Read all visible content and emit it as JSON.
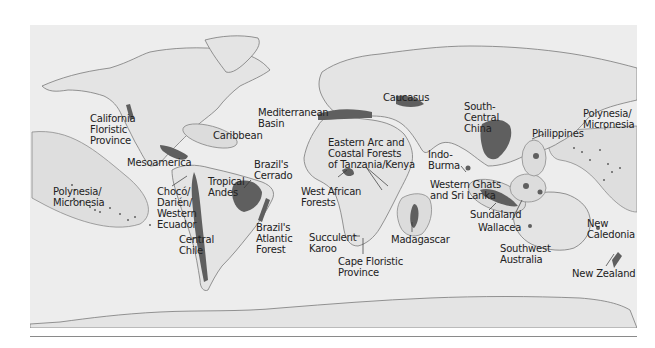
{
  "map": {
    "title": "",
    "colors": {
      "ocean": "#ededed",
      "land": "#e6e6e6",
      "coast": "#7a7a7a",
      "hotspot": "#5f5f5f",
      "region_outline": "#8c8c8c",
      "region_fill": "#dcdcdc",
      "label_text": "#222222",
      "rule": "#8a8a8a"
    },
    "labels": [
      {
        "id": "california",
        "text": "California\nFloristic\nProvince",
        "x": 90,
        "y": 113
      },
      {
        "id": "mesoamerica",
        "text": "Mesoamerica",
        "x": 127,
        "y": 157
      },
      {
        "id": "caribbean",
        "text": "Caribbean",
        "x": 213,
        "y": 130
      },
      {
        "id": "polynesia_west",
        "text": "Polynesia/\nMicronesia",
        "x": 53,
        "y": 186
      },
      {
        "id": "choco",
        "text": "Chocó/\nDarién/\nWestern\nEcuador",
        "x": 157,
        "y": 186
      },
      {
        "id": "tropical_andes",
        "text": "Tropical\nAndes",
        "x": 208,
        "y": 176
      },
      {
        "id": "brazil_cerrado",
        "text": "Brazil's\nCerrado",
        "x": 254,
        "y": 159
      },
      {
        "id": "central_chile",
        "text": "Central\nChile",
        "x": 179,
        "y": 234
      },
      {
        "id": "brazil_atlantic",
        "text": "Brazil's\nAtlantic\nForest",
        "x": 256,
        "y": 222
      },
      {
        "id": "mediterranean",
        "text": "Mediterranean\nBasin",
        "x": 258,
        "y": 107
      },
      {
        "id": "caucasus",
        "text": "Caucasus",
        "x": 383,
        "y": 92
      },
      {
        "id": "eastern_arc",
        "text": "Eastern Arc and\nCoastal Forests\nof Tanzania/Kenya",
        "x": 328,
        "y": 137
      },
      {
        "id": "west_african",
        "text": "West African\nForests",
        "x": 301,
        "y": 186
      },
      {
        "id": "succulent_karoo",
        "text": "Succulent\nKaroo",
        "x": 309,
        "y": 232
      },
      {
        "id": "cape_floristic",
        "text": "Cape Floristic\nProvince",
        "x": 338,
        "y": 256
      },
      {
        "id": "madagascar",
        "text": "Madagascar",
        "x": 391,
        "y": 234
      },
      {
        "id": "south_central_china",
        "text": "South-\nCentral\nChina",
        "x": 464,
        "y": 101
      },
      {
        "id": "indo_burma",
        "text": "Indo-\nBurma",
        "x": 428,
        "y": 149
      },
      {
        "id": "western_ghats",
        "text": "Western Ghats\nand Sri Lanka",
        "x": 430,
        "y": 179
      },
      {
        "id": "philippines",
        "text": "Philippines",
        "x": 532,
        "y": 128
      },
      {
        "id": "polynesia_east",
        "text": "Polynesia/\nMicronesia",
        "x": 583,
        "y": 108
      },
      {
        "id": "sundaland",
        "text": "Sundaland",
        "x": 470,
        "y": 209
      },
      {
        "id": "wallacea",
        "text": "Wallacea",
        "x": 478,
        "y": 222
      },
      {
        "id": "southwest_australia",
        "text": "Southwest\nAustralia",
        "x": 500,
        "y": 243
      },
      {
        "id": "new_caledonia",
        "text": "New\nCaledonia",
        "x": 587,
        "y": 218
      },
      {
        "id": "new_zealand",
        "text": "New Zealand",
        "x": 572,
        "y": 268
      }
    ]
  }
}
